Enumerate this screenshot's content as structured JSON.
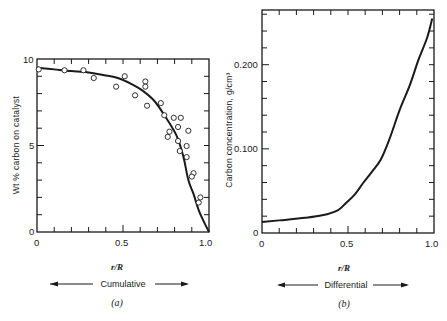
{
  "chart_data": [
    {
      "panel": "a",
      "type": "scatter",
      "panel_label": "(a)",
      "title": "",
      "xlabel": "r/R",
      "ylabel": "Wt % carbon on catalyst",
      "range_label": "Cumulative",
      "xlim": [
        0,
        1.0
      ],
      "ylim": [
        0,
        10
      ],
      "xticks": [
        "0",
        "0.5",
        "1.0"
      ],
      "yticks": [
        "0",
        "5",
        "10"
      ],
      "grid": false,
      "legend": null,
      "series": [
        {
          "name": "measured",
          "kind": "scatter",
          "marker": "open-circle",
          "points": [
            [
              0.01,
              9.4
            ],
            [
              0.16,
              9.35
            ],
            [
              0.27,
              9.35
            ],
            [
              0.33,
              8.9
            ],
            [
              0.46,
              8.4
            ],
            [
              0.51,
              9.0
            ],
            [
              0.57,
              7.9
            ],
            [
              0.63,
              8.7
            ],
            [
              0.63,
              8.4
            ],
            [
              0.64,
              7.3
            ],
            [
              0.72,
              7.45
            ],
            [
              0.74,
              6.75
            ],
            [
              0.795,
              6.6
            ],
            [
              0.836,
              6.6
            ],
            [
              0.82,
              6.07
            ],
            [
              0.77,
              5.8
            ],
            [
              0.76,
              5.5
            ],
            [
              0.88,
              5.85
            ],
            [
              0.82,
              5.26
            ],
            [
              0.87,
              4.97
            ],
            [
              0.83,
              4.68
            ],
            [
              0.87,
              4.33
            ],
            [
              0.91,
              3.4
            ],
            [
              0.9,
              3.2
            ],
            [
              0.95,
              2.0
            ],
            [
              0.94,
              1.7
            ]
          ]
        },
        {
          "name": "fitted curve",
          "kind": "line",
          "points": [
            [
              0.0,
              9.5
            ],
            [
              0.1,
              9.4
            ],
            [
              0.2,
              9.3
            ],
            [
              0.28,
              9.25
            ],
            [
              0.4,
              9.05
            ],
            [
              0.47,
              8.9
            ],
            [
              0.55,
              8.55
            ],
            [
              0.61,
              8.2
            ],
            [
              0.68,
              7.6
            ],
            [
              0.74,
              6.76
            ],
            [
              0.81,
              5.6
            ],
            [
              0.85,
              4.4
            ],
            [
              0.88,
              3.0
            ],
            [
              0.91,
              2.2
            ],
            [
              0.94,
              1.27
            ],
            [
              0.97,
              0.6
            ],
            [
              1.0,
              0.0
            ]
          ]
        }
      ]
    },
    {
      "panel": "b",
      "type": "line",
      "panel_label": "(b)",
      "title": "",
      "xlabel": "r/R",
      "ylabel": "Carbon concentration, g/cm³",
      "range_label": "Differential",
      "xlim": [
        0,
        1.0
      ],
      "ylim": [
        0,
        0.265
      ],
      "xticks": [
        "0",
        "0.5",
        "1.0"
      ],
      "yticks": [
        "0",
        "0.100",
        "0.200"
      ],
      "grid": false,
      "legend": null,
      "series": [
        {
          "name": "carbon concentration",
          "kind": "line",
          "points": [
            [
              0.0,
              0.013
            ],
            [
              0.1,
              0.015
            ],
            [
              0.25,
              0.018
            ],
            [
              0.35,
              0.021
            ],
            [
              0.44,
              0.027
            ],
            [
              0.49,
              0.036
            ],
            [
              0.54,
              0.046
            ],
            [
              0.59,
              0.06
            ],
            [
              0.64,
              0.073
            ],
            [
              0.69,
              0.087
            ],
            [
              0.74,
              0.111
            ],
            [
              0.8,
              0.146
            ],
            [
              0.86,
              0.176
            ],
            [
              0.91,
              0.206
            ],
            [
              0.96,
              0.232
            ],
            [
              0.99,
              0.255
            ]
          ]
        }
      ]
    }
  ]
}
